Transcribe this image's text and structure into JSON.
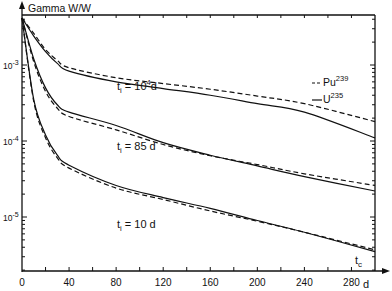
{
  "chart_data": {
    "type": "line",
    "title": "",
    "ylabel": "Gamma W/W",
    "xlabel": "d",
    "x_axis_name": "t_c",
    "yscale": "log",
    "xlim": [
      0,
      300
    ],
    "ylim": [
      2e-06,
      0.0046
    ],
    "x_ticks": [
      0,
      40,
      80,
      120,
      160,
      200,
      240,
      280
    ],
    "x_tick_labels": [
      "0",
      "40",
      "80",
      "120",
      "160",
      "200",
      "240",
      "280"
    ],
    "y_tick_labels": [
      {
        "value": 0.001,
        "base": "10",
        "exp": "-3"
      },
      {
        "value": 0.0001,
        "base": "10",
        "exp": "-4"
      },
      {
        "value": 1e-05,
        "base": "10",
        "exp": "-5"
      }
    ],
    "legend": {
      "placement": "top-right",
      "entries": [
        {
          "name": "Pu",
          "mass": "239",
          "style": "dashed"
        },
        {
          "name": "U",
          "mass": "235",
          "style": "solid"
        }
      ]
    },
    "annotations": [
      {
        "text_base": "t",
        "sub": "i",
        "text_mid": " = 10",
        "sup": "4",
        "text_end": "d",
        "curve": "t_i = 10^4 d"
      },
      {
        "text_base": "t",
        "sub": "i",
        "text_mid": " = 85 d",
        "sup": "",
        "text_end": "",
        "curve": "t_i = 85 d"
      },
      {
        "text_base": "t",
        "sub": "i",
        "text_mid": " = 10 d",
        "sup": "",
        "text_end": "",
        "curve": "t_i = 10 d"
      }
    ],
    "x": [
      0,
      10,
      20,
      30,
      40,
      80,
      120,
      160,
      200,
      240,
      300
    ],
    "series": [
      {
        "name": "U235 t_i=10^4 d",
        "style": "solid",
        "values": [
          0.0045,
          0.0024,
          0.0015,
          0.00105,
          0.00083,
          0.0006,
          0.00049,
          0.0004,
          0.00031,
          0.00024,
          0.00011
        ]
      },
      {
        "name": "Pu239 t_i=10^4 d",
        "style": "dashed",
        "values": [
          0.0045,
          0.0026,
          0.0016,
          0.00115,
          0.00092,
          0.00068,
          0.00057,
          0.00048,
          0.00039,
          0.00031,
          0.00018
        ]
      },
      {
        "name": "U235 t_i=85 d",
        "style": "solid",
        "values": [
          0.0045,
          0.0012,
          0.0005,
          0.0003,
          0.00024,
          0.00016,
          9.5e-05,
          6.5e-05,
          4.7e-05,
          3.4e-05,
          2.2e-05
        ]
      },
      {
        "name": "Pu239 t_i=85 d",
        "style": "dashed",
        "values": [
          0.0045,
          0.0011,
          0.00045,
          0.00027,
          0.00021,
          0.00014,
          9e-05,
          6.4e-05,
          4.9e-05,
          3.7e-05,
          2.6e-05
        ]
      },
      {
        "name": "U235 t_i=10 d",
        "style": "solid",
        "values": [
          0.0045,
          0.00035,
          0.00012,
          6.5e-05,
          4.8e-05,
          2.6e-05,
          1.8e-05,
          1.3e-05,
          9e-06,
          6.3e-06,
          3.5e-06
        ]
      },
      {
        "name": "Pu239 t_i=10 d",
        "style": "dashed",
        "values": [
          0.0045,
          0.00033,
          0.00011,
          6e-05,
          4.4e-05,
          2.4e-05,
          1.7e-05,
          1.2e-05,
          8.8e-06,
          6.3e-06,
          3.7e-06
        ]
      }
    ]
  }
}
